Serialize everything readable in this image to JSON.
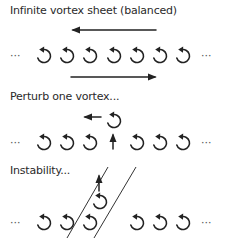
{
  "panels": [
    {
      "caption": "Infinite vortex sheet (balanced)",
      "left_ellipsis": "···",
      "right_ellipsis": "···",
      "vortex_count": 7,
      "rotation": "counter-clockwise",
      "flow_arrows": [
        {
          "position": "above",
          "direction": "left"
        },
        {
          "position": "below",
          "direction": "right"
        }
      ]
    },
    {
      "caption": "Perturb one vortex...",
      "left_ellipsis": "···",
      "right_ellipsis": "···",
      "vortex_count": 6,
      "rotation": "counter-clockwise",
      "perturbed_vortex": {
        "index": 3,
        "displacement": "up",
        "induced_motion": "left"
      }
    },
    {
      "caption": "Instability...",
      "left_ellipsis": "···",
      "right_ellipsis": "···",
      "vortex_count": 6,
      "rotation": "counter-clockwise",
      "perturbed_vortex": {
        "index": 3,
        "displacement": "up-left",
        "induced_motion": "up"
      },
      "guide_lines": 2
    }
  ],
  "icons": {
    "vortex": "counter-clockwise-circular-arrow-icon",
    "arrow": "straight-arrow-icon"
  },
  "colors": {
    "ink": "#222222",
    "text": "#2a2a2a"
  }
}
